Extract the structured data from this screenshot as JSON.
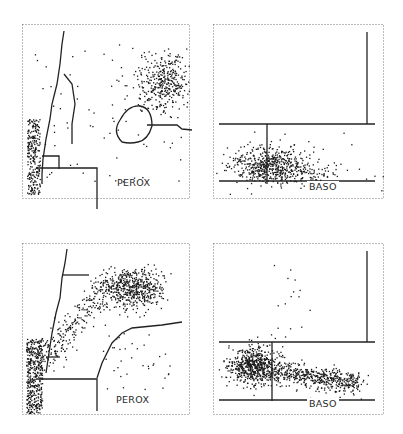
{
  "figure": {
    "panels": [
      {
        "id": "top-left",
        "label": "PEROX"
      },
      {
        "id": "top-right",
        "label": "BASO"
      },
      {
        "id": "bottom-left",
        "label": "PEROX"
      },
      {
        "id": "bottom-right",
        "label": "BASO"
      }
    ]
  },
  "chart_data": [
    {
      "type": "scatter",
      "title": "",
      "panel": "top-left",
      "annotation": "PEROX",
      "xlabel": "",
      "ylabel": "",
      "grid": false,
      "axes_ticks": "dotted frame, ~5 tick marks per side, no numeric labels",
      "clusters": [
        {
          "name": "left vertical band (lymphocytes)",
          "x_range": [
            0.02,
            0.12
          ],
          "y_range": [
            0.05,
            0.45
          ],
          "density": "high"
        },
        {
          "name": "upper-right cluster (neutrophils)",
          "x_center": 0.8,
          "y_center": 0.68,
          "spread": [
            0.14,
            0.12
          ],
          "density": "high"
        },
        {
          "name": "scattered points",
          "density": "low"
        }
      ],
      "gates": "stepped diagonal gate from lower-left to top, horizontal/vertical threshold lines near bottom, circular noise gate at center"
    },
    {
      "type": "scatter",
      "title": "",
      "panel": "top-right",
      "annotation": "BASO",
      "xlabel": "",
      "ylabel": "",
      "grid": false,
      "clusters": [
        {
          "name": "mononuclear cluster",
          "x_center": 0.32,
          "y_center": 0.2,
          "spread": [
            0.2,
            0.06
          ],
          "density": "high"
        }
      ],
      "gates": "horizontal line at ~y=0.45, vertical line at ~x=0.33 below it, vertical line at ~x=0.95 above it, baseline at ~y=0.1"
    },
    {
      "type": "scatter",
      "title": "",
      "panel": "bottom-left",
      "annotation": "PEROX",
      "xlabel": "",
      "ylabel": "",
      "grid": false,
      "clusters": [
        {
          "name": "left vertical band (lymphocytes)",
          "x_range": [
            0.02,
            0.12
          ],
          "y_range": [
            0.05,
            0.42
          ],
          "density": "very high"
        },
        {
          "name": "upper cluster (neutrophils)",
          "x_center": 0.6,
          "y_center": 0.74,
          "spread": [
            0.12,
            0.08
          ],
          "density": "very high"
        },
        {
          "name": "diagonal streak",
          "from": [
            0.1,
            0.35
          ],
          "to": [
            0.5,
            0.8
          ],
          "density": "medium"
        }
      ],
      "gates": "stepped diagonal gate, horizontal line at ~y=0.8 from x=0.22 to 0.4, stepped curve on right rising to ~y=0.55"
    },
    {
      "type": "scatter",
      "title": "",
      "panel": "bottom-right",
      "annotation": "BASO",
      "xlabel": "",
      "ylabel": "",
      "grid": false,
      "clusters": [
        {
          "name": "mononuclear cluster",
          "x_center": 0.25,
          "y_center": 0.28,
          "spread": [
            0.1,
            0.08
          ],
          "density": "very high"
        },
        {
          "name": "polymorphonuclear tail",
          "from": [
            0.35,
            0.24
          ],
          "to": [
            0.85,
            0.18
          ],
          "density": "high"
        },
        {
          "name": "sparse upper points",
          "x_range": [
            0.4,
            0.55
          ],
          "y_range": [
            0.5,
            0.85
          ],
          "density": "low"
        }
      ],
      "gates": "horizontal line at ~y=0.45, vertical line at ~x=0.38 below it, vertical line at ~x=0.95 above it, baseline at ~y=0.1"
    }
  ]
}
